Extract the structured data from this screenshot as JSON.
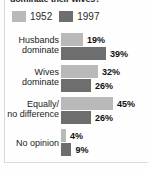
{
  "title": "dominate their wives?",
  "legend": {
    "items": [
      {
        "label": "1952",
        "color": "#b9b9b9",
        "swatch_name": "legend-swatch-1952"
      },
      {
        "label": "1997",
        "color": "#6e6e6e",
        "swatch_name": "legend-swatch-1997"
      }
    ]
  },
  "chart_data": {
    "type": "bar",
    "orientation": "horizontal",
    "title": "dominate their wives?",
    "xlabel": "",
    "ylabel": "",
    "grid": false,
    "legend_position": "top-left",
    "value_suffix": "%",
    "xlim": [
      0,
      50
    ],
    "categories": [
      "Husbands dominate",
      "Wives dominate",
      "Equally/ no difference",
      "No opinion"
    ],
    "category_lines": [
      [
        "Husbands",
        "dominate"
      ],
      [
        "Wives",
        "dominate"
      ],
      [
        "Equally/",
        "no difference"
      ],
      [
        "No opinion",
        ""
      ]
    ],
    "series": [
      {
        "name": "1952",
        "color": "#b9b9b9",
        "values": [
          19,
          32,
          45,
          4
        ]
      },
      {
        "name": "1997",
        "color": "#6e6e6e",
        "values": [
          39,
          26,
          26,
          9
        ]
      }
    ],
    "labels": {
      "1952": [
        "19%",
        "32%",
        "45%",
        "4%"
      ],
      "1997": [
        "39%",
        "26%",
        "26%",
        "9%"
      ]
    }
  }
}
